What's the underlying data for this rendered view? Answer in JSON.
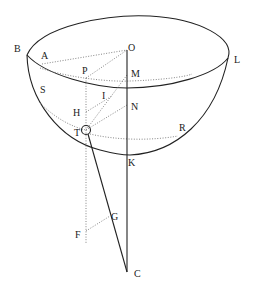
{
  "diagram": {
    "type": "geometric hemisphere figure",
    "colors": {
      "line": "#222222",
      "dotted": "#777777",
      "background": "#ffffff"
    },
    "labels": {
      "B": "B",
      "A": "A",
      "O": "O",
      "L": "L",
      "P": "P",
      "M": "M",
      "S": "S",
      "I": "I",
      "H": "H",
      "N": "N",
      "T": "T",
      "R": "R",
      "K": "K",
      "G": "G",
      "F": "F",
      "C": "C"
    }
  }
}
